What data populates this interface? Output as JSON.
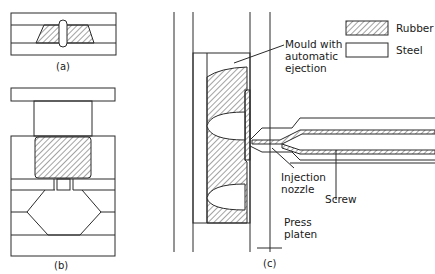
{
  "figure": {
    "parts": [
      {
        "id": "a",
        "caption": "(a)"
      },
      {
        "id": "b",
        "caption": "(b)"
      },
      {
        "id": "c",
        "caption": "(c)"
      }
    ],
    "legend": [
      {
        "label": "Rubber",
        "swatch": "hatched"
      },
      {
        "label": "Steel",
        "swatch": "blank"
      }
    ],
    "annotations": {
      "mould": [
        "Mould with",
        "automatic",
        "ejection"
      ],
      "nozzle": [
        "Injection",
        "nozzle"
      ],
      "screw": "Screw",
      "platen": [
        "Press",
        "platen"
      ]
    },
    "colors": {
      "line": "#2a2a2a",
      "background": "#ffffff"
    }
  }
}
